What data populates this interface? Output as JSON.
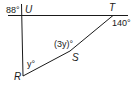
{
  "diagram": {
    "type": "geometry-figure",
    "points": {
      "U": {
        "label": "U"
      },
      "T": {
        "label": "T"
      },
      "S": {
        "label": "S"
      },
      "R": {
        "label": "R"
      }
    },
    "angles": {
      "at_U": "88°",
      "at_T": "140°",
      "at_S": "(3y)°",
      "at_R": "y°"
    },
    "colors": {
      "line": "#1a1a1a",
      "background": "#ffffff"
    }
  }
}
